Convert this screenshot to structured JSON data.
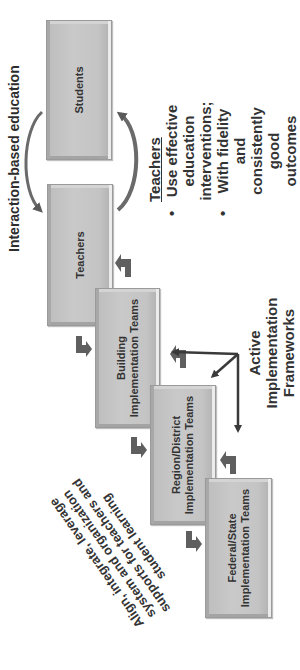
{
  "diagram": {
    "orientation": "rotated-90-ccw",
    "colors": {
      "box_fill": "#c4c4c4",
      "box_border": "#9a9a9a",
      "arrow": "#5a5a5a",
      "text": "#333333",
      "background": "#ffffff"
    },
    "boxes": [
      {
        "id": "students",
        "lines": [
          "Students"
        ]
      },
      {
        "id": "teachers",
        "lines": [
          "Teachers"
        ]
      },
      {
        "id": "building",
        "lines": [
          "Building",
          "Implementation Teams"
        ]
      },
      {
        "id": "region",
        "lines": [
          "Region/District",
          "Implementation Teams"
        ]
      },
      {
        "id": "federal",
        "lines": [
          "Federal/State",
          "Implementation Teams"
        ]
      }
    ],
    "cycle_label": "Interaction-based education",
    "teachers_note": {
      "title": "Teachers",
      "bullets": [
        "Use effective education interventions;",
        "With fidelity and consistently good outcomes"
      ]
    },
    "frameworks_label": {
      "lines": [
        "Active",
        "Implementation",
        "Frameworks"
      ]
    },
    "align_note": {
      "lines": [
        "Align, integrate, leverage",
        "system and organization",
        "supports for teachers and",
        "student learning"
      ]
    },
    "icons": {
      "cycle_arrows": "curved-arrow",
      "step_arrows": "bent-block-arrow",
      "framework_axes": "three-axis-arrows"
    }
  }
}
